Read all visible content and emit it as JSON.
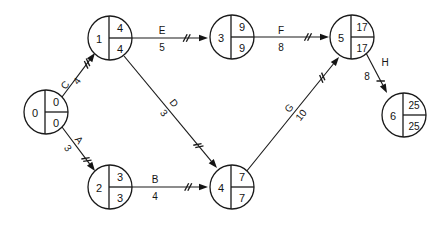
{
  "diagram": {
    "type": "network-diagram",
    "colors": {
      "background": "#ffffff",
      "stroke": "#1a1a1a",
      "text": "#141414"
    },
    "node_legend": {
      "left_cell": "event number",
      "top_right_cell": "earliest event time",
      "bottom_right_cell": "latest event time"
    },
    "nodes": [
      {
        "id": "0",
        "earliest": "0",
        "latest": "0",
        "cx": 46,
        "cy": 112,
        "r": 22
      },
      {
        "id": "1",
        "earliest": "4",
        "latest": "4",
        "cx": 110,
        "cy": 38,
        "r": 22
      },
      {
        "id": "2",
        "earliest": "3",
        "latest": "3",
        "cx": 110,
        "cy": 187,
        "r": 22
      },
      {
        "id": "3",
        "earliest": "9",
        "latest": "9",
        "cx": 232,
        "cy": 37,
        "r": 22
      },
      {
        "id": "4",
        "earliest": "7",
        "latest": "7",
        "cx": 232,
        "cy": 187,
        "r": 22
      },
      {
        "id": "5",
        "earliest": "17",
        "latest": "17",
        "cx": 352,
        "cy": 37,
        "r": 22
      },
      {
        "id": "6",
        "earliest": "25",
        "latest": "25",
        "cx": 404,
        "cy": 115,
        "r": 22
      }
    ],
    "edges": [
      {
        "name": "C",
        "duration": "4",
        "from": "0",
        "to": "1",
        "x1": 62,
        "y1": 97,
        "x2": 95,
        "y2": 53,
        "label_x": 65,
        "label_y": 85,
        "label_rot": -52,
        "dur_x": 77,
        "dur_y": 81,
        "dur_rot": -52,
        "ticks": 2,
        "tick_t": 0.76
      },
      {
        "name": "A",
        "duration": "3",
        "from": "0",
        "to": "2",
        "x1": 62,
        "y1": 127,
        "x2": 95,
        "y2": 171,
        "label_x": 79,
        "label_y": 140,
        "label_rot": 52,
        "dur_x": 68,
        "dur_y": 148,
        "dur_rot": 52,
        "ticks": 2,
        "tick_t": 0.74
      },
      {
        "name": "E",
        "duration": "5",
        "from": "1",
        "to": "3",
        "x1": 132,
        "y1": 38,
        "x2": 208,
        "y2": 38,
        "label_x": 162,
        "label_y": 30,
        "label_rot": 0,
        "dur_x": 162,
        "dur_y": 47,
        "dur_rot": 0,
        "ticks": 2,
        "tick_t": 0.72
      },
      {
        "name": "F",
        "duration": "8",
        "from": "3",
        "to": "5",
        "x1": 254,
        "y1": 37,
        "x2": 329,
        "y2": 37,
        "label_x": 281,
        "label_y": 30,
        "label_rot": 0,
        "dur_x": 281,
        "dur_y": 47,
        "dur_rot": 0,
        "ticks": 2,
        "tick_t": 0.72
      },
      {
        "name": "D",
        "duration": "3",
        "from": "1",
        "to": "4",
        "x1": 124,
        "y1": 56,
        "x2": 217,
        "y2": 168,
        "label_x": 174,
        "label_y": 103,
        "label_rot": 50,
        "dur_x": 164,
        "dur_y": 113,
        "dur_rot": 50,
        "ticks": 2,
        "tick_t": 0.8
      },
      {
        "name": "B",
        "duration": "4",
        "from": "2",
        "to": "4",
        "x1": 132,
        "y1": 187,
        "x2": 208,
        "y2": 187,
        "label_x": 155,
        "label_y": 179,
        "label_rot": 0,
        "dur_x": 155,
        "dur_y": 196,
        "dur_rot": 0,
        "ticks": 2,
        "tick_t": 0.74
      },
      {
        "name": "G",
        "duration": "10",
        "from": "4",
        "to": "5",
        "x1": 246,
        "y1": 172,
        "x2": 339,
        "y2": 57,
        "label_x": 289,
        "label_y": 108,
        "label_rot": -51,
        "dur_x": 301,
        "dur_y": 115,
        "dur_rot": -51,
        "ticks": 2,
        "tick_t": 0.82
      },
      {
        "name": "H",
        "duration": "8",
        "from": "5",
        "to": "6",
        "x1": 366,
        "y1": 53,
        "x2": 387,
        "y2": 93,
        "label_x": 385,
        "label_y": 62,
        "label_rot": 0,
        "dur_x": 367,
        "dur_y": 76,
        "dur_rot": 0,
        "ticks": 1,
        "tick_t": 0.7
      }
    ]
  }
}
